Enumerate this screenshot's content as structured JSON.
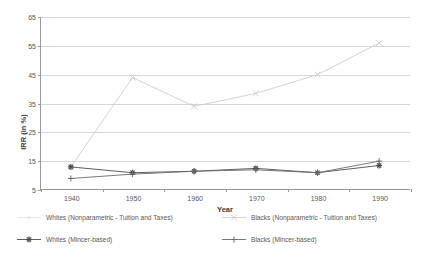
{
  "chart_data": {
    "type": "line",
    "title": "",
    "xlabel": "Year",
    "ylabel": "IRR (in %)",
    "categories": [
      1940,
      1950,
      1960,
      1970,
      1980,
      1990
    ],
    "xtick_labels": [
      "1940",
      "1950",
      "1960",
      "1970",
      "1980",
      "1990"
    ],
    "ytick_labels": [
      "5",
      "15",
      "25",
      "35",
      "45",
      "55",
      "65"
    ],
    "yticks": [
      5,
      15,
      25,
      35,
      45,
      55,
      65
    ],
    "ylim": [
      5,
      65
    ],
    "grid": true,
    "legend_position": "bottom",
    "series": [
      {
        "name": "Whites (Nonparametric - Tuition and Taxes)",
        "marker": "dot",
        "color": "#e8e8e8",
        "values": [
          null,
          null,
          null,
          null,
          null,
          null
        ]
      },
      {
        "name": "Blacks (Nonparametric - Tuition and Taxes)",
        "marker": "x",
        "color": "#cfcfcf",
        "values": [
          13,
          44,
          34,
          38.5,
          45,
          56
        ]
      },
      {
        "name": "Whites (Mincer-based)",
        "marker": "asterisk",
        "color": "#4d4d4d",
        "values": [
          13,
          11,
          11.5,
          12.5,
          11,
          13.5
        ]
      },
      {
        "name": "Blacks (Mincer-based)",
        "marker": "plus",
        "color": "#6b6b6b",
        "values": [
          9,
          10.5,
          11.5,
          12,
          11,
          15
        ]
      }
    ]
  },
  "legend": {
    "items": [
      {
        "label": "Whites (Nonparametric - Tuition and Taxes)"
      },
      {
        "label": "Blacks (Nonparametric - Tuition and Taxes)"
      },
      {
        "label": "Whites (Mincer-based)"
      },
      {
        "label": "Blacks (Mincer-based)"
      }
    ]
  }
}
